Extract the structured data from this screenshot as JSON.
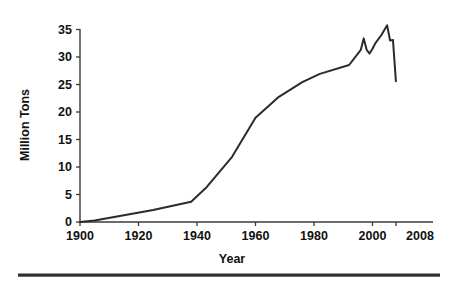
{
  "chart_data": {
    "type": "line",
    "title": "",
    "xlabel": "Year",
    "ylabel": "Million Tons",
    "xlim": [
      1900,
      2008
    ],
    "ylim": [
      0,
      37
    ],
    "grid": false,
    "legend": null,
    "xticks": [
      1900,
      1920,
      1940,
      1960,
      1980,
      2000,
      2008
    ],
    "xtick_labels": [
      "1900",
      "1920",
      "1940",
      "1960",
      "1980",
      "2000",
      "2008"
    ],
    "yticks": [
      0,
      5,
      10,
      15,
      20,
      25,
      30,
      35
    ],
    "ytick_labels": [
      "0",
      "5",
      "10",
      "15",
      "20",
      "25",
      "30",
      "35"
    ],
    "series": [
      {
        "name": "Production",
        "x": [
          1900,
          1905,
          1925,
          1938,
          1943,
          1952,
          1960,
          1968,
          1976,
          1982,
          1992,
          1996,
          1997,
          1998,
          1999,
          2000,
          2001,
          2003,
          2005,
          2006,
          2007,
          2008
        ],
        "values": [
          0.0,
          0.3,
          2.3,
          3.9,
          6.5,
          12.5,
          20.0,
          24.0,
          26.8,
          28.4,
          30.1,
          33.0,
          35.2,
          33.0,
          32.3,
          33.2,
          34.3,
          35.8,
          37.7,
          34.8,
          34.9,
          27.0
        ]
      }
    ],
    "axis_color": "#3a3a3a",
    "line_color": "#2b2b2b",
    "background_color": "#ffffff",
    "footer_rule_color": "#2e2e34"
  }
}
